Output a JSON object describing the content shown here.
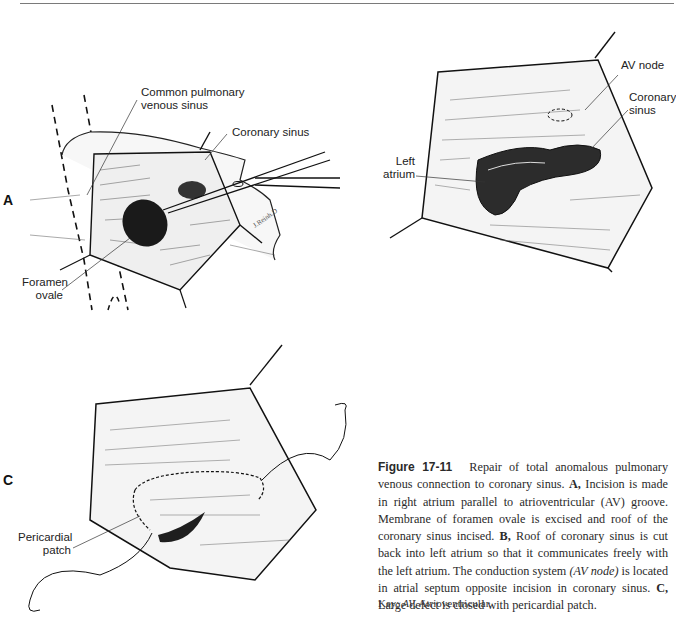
{
  "figure": {
    "number": "Figure 17-11",
    "panels": {
      "A": {
        "letter": "A",
        "labels": {
          "common_pulmonary": [
            "Common pulmonary",
            "venous sinus"
          ],
          "coronary_sinus": "Coronary sinus",
          "foramen_ovale": [
            "Foramen",
            "ovale"
          ]
        }
      },
      "B": {
        "labels": {
          "av_node": "AV node",
          "coronary_sinus": [
            "Coronary",
            "sinus"
          ],
          "left_atrium": [
            "Left",
            "atrium"
          ]
        }
      },
      "C": {
        "letter": "C",
        "labels": {
          "pericardial_patch": [
            "Pericardial",
            "patch"
          ]
        }
      }
    },
    "caption": {
      "intro": "Repair of total anomalous pulmonary venous connection to coronary sinus.",
      "a_letter": "A,",
      "a_text": "Incision is made in right atrium parallel to atrioventricular (AV) groove. Membrane of foramen ovale is excised and roof of the coronary sinus incised.",
      "b_letter": "B,",
      "b_text_1": "Roof of coronary sinus is cut back into left atrium so that it communicates freely with the left atrium. The conduction system",
      "b_italic": "(AV node)",
      "b_text_2": "is located in atrial septum opposite incision in coronary sinus.",
      "c_letter": "C,",
      "c_text": "Large defect is closed with pericardial patch."
    },
    "key": {
      "prefix": "Key:",
      "abbr": "AV,",
      "meaning": "Atrioventricular."
    }
  }
}
